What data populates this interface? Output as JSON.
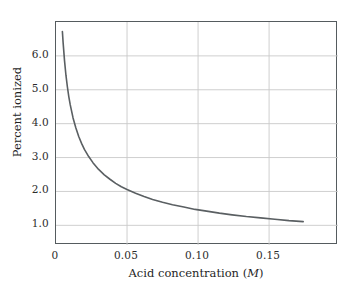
{
  "chart_data": {
    "type": "line",
    "title": "",
    "xlabel": "Acid concentration (M)",
    "xlabel_text": "Acid concentration (",
    "xlabel_symbol": "M",
    "xlabel_tail": ")",
    "ylabel": "Percent ionized",
    "xlim": [
      0,
      0.1985
    ],
    "ylim": [
      0.42,
      7.0
    ],
    "xticks": [
      0,
      0.05,
      0.1,
      0.15
    ],
    "xtick_labels": [
      "0",
      "0.05",
      "0.10",
      "0.15"
    ],
    "yticks": [
      1.0,
      2.0,
      3.0,
      4.0,
      5.0,
      6.0
    ],
    "ytick_labels": [
      "1.0",
      "2.0",
      "3.0",
      "4.0",
      "5.0",
      "6.0"
    ],
    "grid": true,
    "grid_color": "#c9c9c9",
    "legend": "none",
    "series": [
      {
        "name": "percent ionized",
        "line_color": "#5a5f62",
        "line_width": 1.6,
        "x": [
          0.0045,
          0.005,
          0.006,
          0.007,
          0.008,
          0.009,
          0.01,
          0.012,
          0.014,
          0.016,
          0.018,
          0.02,
          0.023,
          0.026,
          0.03,
          0.034,
          0.038,
          0.042,
          0.046,
          0.05,
          0.056,
          0.062,
          0.068,
          0.075,
          0.082,
          0.09,
          0.098,
          0.106,
          0.115,
          0.124,
          0.134,
          0.144,
          0.154,
          0.164,
          0.174
        ],
        "y": [
          6.72,
          6.4,
          5.86,
          5.43,
          5.09,
          4.8,
          4.56,
          4.17,
          3.87,
          3.62,
          3.42,
          3.24,
          3.03,
          2.85,
          2.65,
          2.49,
          2.36,
          2.24,
          2.14,
          2.06,
          1.95,
          1.85,
          1.76,
          1.68,
          1.61,
          1.54,
          1.47,
          1.42,
          1.36,
          1.31,
          1.26,
          1.22,
          1.18,
          1.14,
          1.11
        ]
      }
    ],
    "annotation": "Percent ionization decreases as acid concentration increases (Ostwald dilution)."
  },
  "figure": {
    "background_color": "#ffffff",
    "frame_color": "#555b5e"
  }
}
